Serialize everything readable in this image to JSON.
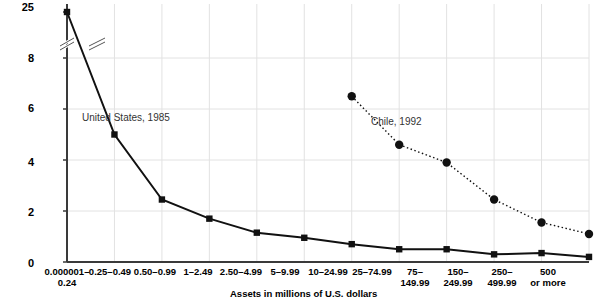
{
  "chart_data": {
    "type": "line",
    "title": "",
    "subtitle": "",
    "xlabel": "Assets in millions of U.S. dollars",
    "ylabel": "",
    "grid": true,
    "legend_position": "inline-annotation",
    "axis_break": true,
    "categories": [
      "0.000001–\n0.24",
      "0.25–0.49",
      "0.50–0.99",
      "1–2.49",
      "2.50–4.99",
      "5–9.99",
      "10–24.99",
      "25–74.99",
      "75–\n149.99",
      "150–\n249.99",
      "250–\n499.99",
      "500\nor more"
    ],
    "ytick_labels": [
      "0",
      "2",
      "4",
      "6",
      "8",
      "25"
    ],
    "ytick_values": [
      0,
      2,
      4,
      6,
      8,
      25
    ],
    "ylim": [
      0,
      25
    ],
    "series": [
      {
        "name": "United States, 1985",
        "marker": "square",
        "line_style": "solid",
        "color": "#111111",
        "values": [
          25.0,
          5.0,
          2.45,
          1.7,
          1.15,
          0.95,
          0.7,
          0.5,
          0.5,
          0.3,
          0.35,
          0.2
        ]
      },
      {
        "name": "Chile, 1992",
        "marker": "circle",
        "line_style": "dotted",
        "color": "#111111",
        "values": [
          null,
          null,
          null,
          null,
          null,
          null,
          6.5,
          4.6,
          3.9,
          2.45,
          1.55,
          1.1
        ]
      }
    ],
    "annotations": [
      {
        "text": "United States, 1985",
        "x_px": 82,
        "y_px": 112
      },
      {
        "text": "Chile, 1992",
        "x_px": 371,
        "y_px": 116
      }
    ]
  }
}
